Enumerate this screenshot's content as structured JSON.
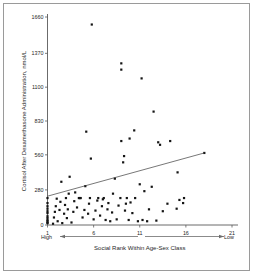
{
  "figure": {
    "background_color": "#ffffff",
    "frame_color": "#9a9a9a",
    "point_color": "#141414",
    "axis_color": "#5a5a5a"
  },
  "axes": {
    "y_title": "Cortisol After Dexamethasone Administration, nmol/L",
    "x_title": "Social Rank Within Age-Sex Class",
    "x_left_annotation": "High",
    "x_right_annotation": "Low",
    "y_ticks": [
      "0",
      "280",
      "560",
      "830",
      "1100",
      "1370",
      "1660"
    ],
    "x_ticks": [
      "1",
      "6",
      "11",
      "16",
      "21"
    ]
  },
  "chart_data": {
    "type": "scatter",
    "title": "",
    "xlabel": "Social Rank Within Age-Sex Class",
    "ylabel": "Cortisol After Dexamethasone Administration, nmol/L",
    "xlim": [
      1,
      21
    ],
    "ylim": [
      0,
      1660
    ],
    "xticks": [
      1,
      6,
      11,
      16,
      21
    ],
    "yticks": [
      0,
      280,
      560,
      830,
      1100,
      1370,
      1660
    ],
    "grid": false,
    "legend": "none",
    "x_axis_direction_note": "High rank at left (1), Low rank at right (21)",
    "series": [
      {
        "name": "Subjects",
        "marker": "filled-square",
        "points": [
          [
            1,
            15
          ],
          [
            1,
            20
          ],
          [
            1,
            30
          ],
          [
            1,
            40
          ],
          [
            1,
            55
          ],
          [
            1,
            70
          ],
          [
            1,
            95
          ],
          [
            1,
            110
          ],
          [
            1,
            130
          ],
          [
            1,
            150
          ],
          [
            1,
            175
          ],
          [
            1,
            215
          ],
          [
            1.6,
            10
          ],
          [
            1.7,
            60
          ],
          [
            1.8,
            105
          ],
          [
            1.9,
            150
          ],
          [
            2.0,
            210
          ],
          [
            2.1,
            30
          ],
          [
            2.3,
            120
          ],
          [
            2.4,
            185
          ],
          [
            2.5,
            345
          ],
          [
            2.6,
            15
          ],
          [
            2.8,
            90
          ],
          [
            2.9,
            160
          ],
          [
            3.0,
            215
          ],
          [
            3.1,
            55
          ],
          [
            3.2,
            125
          ],
          [
            3.3,
            250
          ],
          [
            3.4,
            385
          ],
          [
            3.6,
            20
          ],
          [
            3.8,
            105
          ],
          [
            3.9,
            190
          ],
          [
            4.0,
            260
          ],
          [
            4.2,
            140
          ],
          [
            4.4,
            215
          ],
          [
            4.5,
            215
          ],
          [
            4.6,
            215
          ],
          [
            4.8,
            60
          ],
          [
            5.0,
            120
          ],
          [
            5.1,
            310
          ],
          [
            5.2,
            745
          ],
          [
            5.4,
            90
          ],
          [
            5.5,
            170
          ],
          [
            5.6,
            215
          ],
          [
            5.7,
            530
          ],
          [
            5.8,
            1600
          ],
          [
            6.0,
            45
          ],
          [
            6.2,
            115
          ],
          [
            6.4,
            195
          ],
          [
            6.5,
            215
          ],
          [
            6.7,
            75
          ],
          [
            6.9,
            150
          ],
          [
            7.0,
            205
          ],
          [
            7.1,
            215
          ],
          [
            7.3,
            40
          ],
          [
            7.5,
            125
          ],
          [
            7.6,
            175
          ],
          [
            7.8,
            30
          ],
          [
            8.0,
            100
          ],
          [
            8.1,
            250
          ],
          [
            8.3,
            370
          ],
          [
            8.5,
            45
          ],
          [
            8.7,
            155
          ],
          [
            8.9,
            215
          ],
          [
            9.0,
            670
          ],
          [
            9.0,
            1290
          ],
          [
            9.0,
            1240
          ],
          [
            9.2,
            500
          ],
          [
            9.3,
            550
          ],
          [
            9.4,
            115
          ],
          [
            9.5,
            170
          ],
          [
            9.6,
            215
          ],
          [
            9.8,
            40
          ],
          [
            9.9,
            690
          ],
          [
            10.0,
            180
          ],
          [
            10.2,
            95
          ],
          [
            10.4,
            755
          ],
          [
            10.5,
            215
          ],
          [
            10.8,
            30
          ],
          [
            11.0,
            325
          ],
          [
            11.2,
            1170
          ],
          [
            11.3,
            40
          ],
          [
            11.5,
            270
          ],
          [
            11.8,
            30
          ],
          [
            12.0,
            125
          ],
          [
            12.3,
            305
          ],
          [
            12.5,
            905
          ],
          [
            12.8,
            35
          ],
          [
            13.0,
            660
          ],
          [
            13.2,
            640
          ],
          [
            13.5,
            110
          ],
          [
            14.0,
            170
          ],
          [
            14.3,
            670
          ],
          [
            15.0,
            130
          ],
          [
            15.1,
            420
          ],
          [
            15.3,
            200
          ],
          [
            15.7,
            175
          ],
          [
            15.8,
            215
          ],
          [
            18.0,
            575
          ]
        ]
      }
    ],
    "trendline": {
      "type": "linear-fit",
      "x_start": 1,
      "y_start": 230,
      "x_end": 18,
      "y_end": 575
    }
  }
}
